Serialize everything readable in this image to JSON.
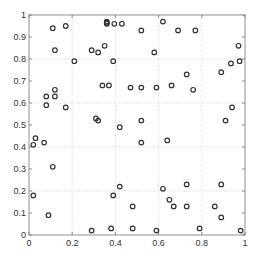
{
  "chart_data": {
    "type": "scatter",
    "title": "",
    "xlabel": "",
    "ylabel": "",
    "xlim": [
      0,
      1
    ],
    "ylim": [
      0,
      1
    ],
    "grid": true,
    "legend": null,
    "marker": "circle-open",
    "marker_color": "#333333",
    "x_ticks": [
      0,
      0.2,
      0.4,
      0.6,
      0.8,
      1
    ],
    "x_tick_labels": [
      "0",
      "0.2",
      "0.4",
      "0.6",
      "0.8",
      "1"
    ],
    "y_ticks": [
      0,
      0.1,
      0.2,
      0.3,
      0.4,
      0.5,
      0.6,
      0.7,
      0.8,
      0.9,
      1
    ],
    "y_tick_labels": [
      "0",
      "0.1",
      "0.2",
      "0.3",
      "0.4",
      "0.5",
      "0.6",
      "0.7",
      "0.8",
      "0.9",
      "1"
    ],
    "points": [
      {
        "x": 0.11,
        "y": 0.94
      },
      {
        "x": 0.17,
        "y": 0.95
      },
      {
        "x": 0.12,
        "y": 0.84
      },
      {
        "x": 0.21,
        "y": 0.79
      },
      {
        "x": 0.29,
        "y": 0.84
      },
      {
        "x": 0.32,
        "y": 0.83
      },
      {
        "x": 0.35,
        "y": 0.86
      },
      {
        "x": 0.39,
        "y": 0.79
      },
      {
        "x": 0.36,
        "y": 0.97
      },
      {
        "x": 0.36,
        "y": 0.965
      },
      {
        "x": 0.36,
        "y": 0.96
      },
      {
        "x": 0.395,
        "y": 0.96
      },
      {
        "x": 0.43,
        "y": 0.96
      },
      {
        "x": 0.52,
        "y": 0.93
      },
      {
        "x": 0.62,
        "y": 0.97
      },
      {
        "x": 0.58,
        "y": 0.83
      },
      {
        "x": 0.69,
        "y": 0.93
      },
      {
        "x": 0.77,
        "y": 0.93
      },
      {
        "x": 0.97,
        "y": 0.86
      },
      {
        "x": 0.935,
        "y": 0.78
      },
      {
        "x": 0.975,
        "y": 0.79
      },
      {
        "x": 0.73,
        "y": 0.73
      },
      {
        "x": 0.89,
        "y": 0.74
      },
      {
        "x": 0.66,
        "y": 0.68
      },
      {
        "x": 0.08,
        "y": 0.63
      },
      {
        "x": 0.08,
        "y": 0.59
      },
      {
        "x": 0.12,
        "y": 0.66
      },
      {
        "x": 0.12,
        "y": 0.63
      },
      {
        "x": 0.17,
        "y": 0.58
      },
      {
        "x": 0.34,
        "y": 0.68
      },
      {
        "x": 0.37,
        "y": 0.68
      },
      {
        "x": 0.31,
        "y": 0.53
      },
      {
        "x": 0.32,
        "y": 0.52
      },
      {
        "x": 0.03,
        "y": 0.44
      },
      {
        "x": 0.02,
        "y": 0.41
      },
      {
        "x": 0.07,
        "y": 0.42
      },
      {
        "x": 0.47,
        "y": 0.67
      },
      {
        "x": 0.52,
        "y": 0.67
      },
      {
        "x": 0.59,
        "y": 0.67
      },
      {
        "x": 0.76,
        "y": 0.66
      },
      {
        "x": 0.42,
        "y": 0.49
      },
      {
        "x": 0.52,
        "y": 0.52
      },
      {
        "x": 0.52,
        "y": 0.42
      },
      {
        "x": 0.64,
        "y": 0.43
      },
      {
        "x": 0.94,
        "y": 0.58
      },
      {
        "x": 0.91,
        "y": 0.52
      },
      {
        "x": 0.11,
        "y": 0.31
      },
      {
        "x": 0.02,
        "y": 0.18
      },
      {
        "x": 0.09,
        "y": 0.09
      },
      {
        "x": 0.29,
        "y": 0.02
      },
      {
        "x": 0.42,
        "y": 0.22
      },
      {
        "x": 0.39,
        "y": 0.18
      },
      {
        "x": 0.48,
        "y": 0.13
      },
      {
        "x": 0.38,
        "y": 0.03
      },
      {
        "x": 0.48,
        "y": 0.03
      },
      {
        "x": 0.59,
        "y": 0.02
      },
      {
        "x": 0.62,
        "y": 0.21
      },
      {
        "x": 0.65,
        "y": 0.16
      },
      {
        "x": 0.67,
        "y": 0.13
      },
      {
        "x": 0.73,
        "y": 0.23
      },
      {
        "x": 0.73,
        "y": 0.13
      },
      {
        "x": 0.89,
        "y": 0.23
      },
      {
        "x": 0.86,
        "y": 0.13
      },
      {
        "x": 0.89,
        "y": 0.08
      },
      {
        "x": 0.79,
        "y": 0.03
      },
      {
        "x": 0.98,
        "y": 0.02
      }
    ]
  },
  "layout": {
    "plot_left": 29,
    "plot_top": 15,
    "plot_width": 216,
    "plot_height": 220,
    "grid_color": "#bbbbbb",
    "axis_color": "#777777"
  }
}
